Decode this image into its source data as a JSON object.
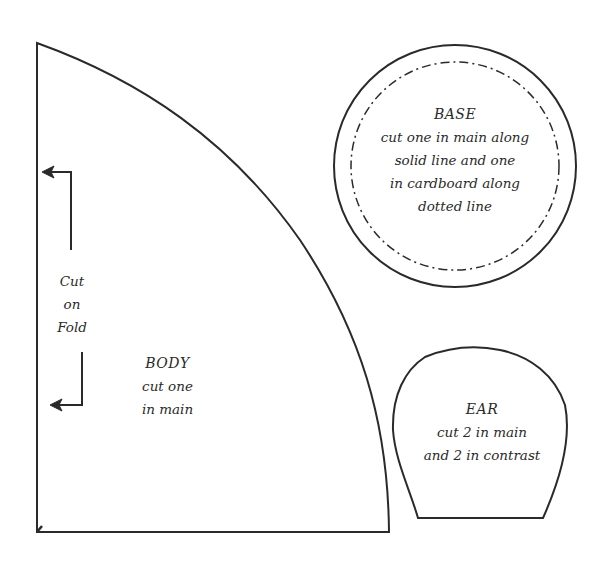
{
  "pattern": {
    "body": {
      "title": "BODY",
      "line1": "cut one",
      "line2": "in main"
    },
    "fold": {
      "line1": "Cut",
      "line2": "on",
      "line3": "Fold"
    },
    "base": {
      "title": "BASE",
      "line1": "cut one in main along",
      "line2": "solid line and one",
      "line3": "in cardboard along",
      "line4": "dotted line"
    },
    "ear": {
      "title": "EAR",
      "line1": "cut 2 in main",
      "line2": "and 2 in contrast"
    },
    "colors": {
      "line": "#2a2a2a",
      "background": "#ffffff"
    }
  }
}
